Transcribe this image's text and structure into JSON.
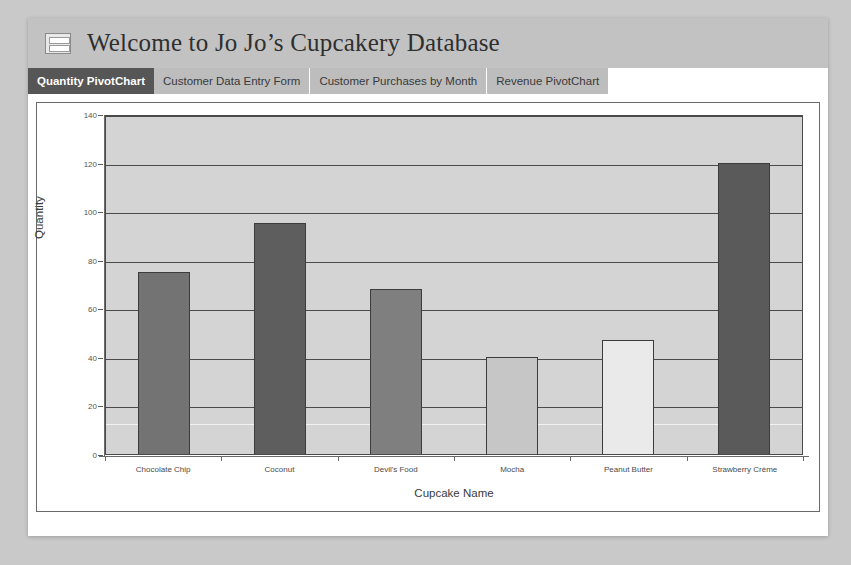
{
  "window": {
    "header": {
      "title": "Welcome to Jo Jo’s Cupcakery Database",
      "icon": "form-table-icon"
    },
    "tabs": [
      {
        "label": "Quantity PivotChart",
        "active": true
      },
      {
        "label": "Customer Data Entry Form",
        "active": false
      },
      {
        "label": "Customer Purchases by Month",
        "active": false
      },
      {
        "label": "Revenue PivotChart",
        "active": false
      }
    ]
  },
  "colors": {
    "page_background": "#c9c9c9",
    "window_background": "#ffffff",
    "header_band": "#c2c2c2",
    "tabstrip": "#bdbdbd",
    "active_tab": "#565656",
    "plot_background": "#d4d4d4",
    "gridline": "#4a4a4a",
    "bar_border": "#3c3c3c"
  },
  "chart_data": {
    "type": "bar",
    "title": "",
    "xlabel": "Cupcake Name",
    "ylabel": "Quantity",
    "ylim": [
      0,
      140
    ],
    "yticks": [
      0,
      20,
      40,
      60,
      80,
      100,
      120,
      140
    ],
    "ytick_labels": [
      "0",
      "20",
      "40",
      "60",
      "80",
      "100",
      "120",
      "140"
    ],
    "grid": true,
    "legend": "none",
    "categories": [
      "Chocolate Chip",
      "Coconut",
      "Devil's Food",
      "Mocha",
      "Peanut Butter",
      "Strawberry Crème"
    ],
    "values": [
      75,
      95,
      68,
      40,
      47,
      120
    ],
    "bar_colors": [
      "#737373",
      "#5e5e5e",
      "#7f7f7f",
      "#c6c6c6",
      "#eaeaea",
      "#5a5a5a"
    ]
  }
}
